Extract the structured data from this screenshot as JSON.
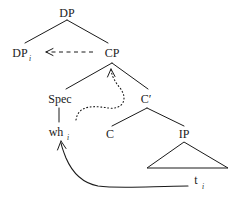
{
  "diagram": {
    "kind": "syntax-tree",
    "title": "",
    "background_color": "#ffffff",
    "line_color": "#1a1a1a",
    "nodes": {
      "root_dp": {
        "label": "DP",
        "subscript": ""
      },
      "dp_moved": {
        "label": "DP",
        "subscript": "i"
      },
      "cp": {
        "label": "CP",
        "subscript": ""
      },
      "spec": {
        "label": "Spec",
        "subscript": ""
      },
      "cbar": {
        "label": "C′",
        "subscript": ""
      },
      "wh": {
        "label": "wh",
        "subscript": "i"
      },
      "c_head": {
        "label": "C",
        "subscript": ""
      },
      "ip": {
        "label": "IP",
        "subscript": ""
      },
      "trace": {
        "label": "t",
        "subscript": "i"
      }
    },
    "movement_arrows": [
      {
        "name": "cp-to-dp-dashed",
        "style": "dashed",
        "from": "CP",
        "to": "DP"
      },
      {
        "name": "c-to-cp-dotted",
        "style": "dotted",
        "from": "C",
        "to": "CP"
      },
      {
        "name": "trace-to-wh-solid",
        "style": "solid",
        "from": "t",
        "to": "wh"
      }
    ]
  }
}
